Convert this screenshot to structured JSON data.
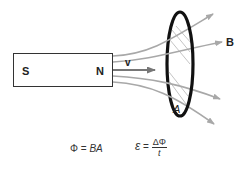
{
  "diagram": {
    "magnet": {
      "south_label": "S",
      "north_label": "N"
    },
    "velocity_label": "v",
    "field_label": "B",
    "area_label": "A",
    "colors": {
      "field_lines": "#a8a8a8",
      "velocity_arrow": "#777777",
      "ring": "#111111",
      "outline": "#333333"
    }
  },
  "equations": {
    "flux": {
      "lhs": "Φ",
      "eq": " = ",
      "rhs": "BA"
    },
    "emf": {
      "lhs": "ε",
      "eq": " = ",
      "numerator": "ΔΦ",
      "denominator": "t"
    }
  }
}
